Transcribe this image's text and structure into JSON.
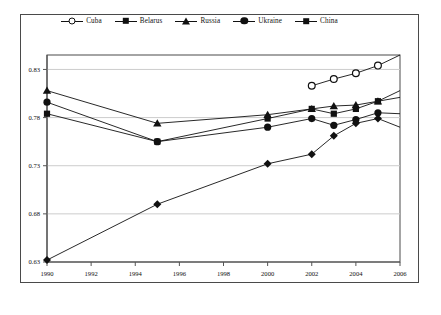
{
  "chart_data": {
    "type": "line",
    "title": "",
    "xlabel": "",
    "ylabel": "",
    "xlim": [
      1990,
      2006
    ],
    "ylim": [
      0.63,
      0.845
    ],
    "grid": true,
    "legend_position": "top-center",
    "xticks": [
      1990,
      1992,
      1994,
      1996,
      1998,
      2000,
      2002,
      2004,
      2006
    ],
    "xtick_labels": [
      "1990",
      "1992",
      "1994",
      "1996",
      "1998",
      "2000",
      "2002",
      "2004",
      "2006"
    ],
    "yticks": [
      0.63,
      0.68,
      0.73,
      0.78,
      0.83
    ],
    "ytick_labels": [
      "0.63",
      "0.68",
      "0.73",
      "0.78",
      "0.83"
    ],
    "series": [
      {
        "name": "Cuba",
        "marker": "open-circle",
        "color": "#111111",
        "x": [
          2002,
          2003,
          2004,
          2005,
          2006
        ],
        "values": [
          0.813,
          0.82,
          0.826,
          0.834,
          0.845
        ]
      },
      {
        "name": "Belarus",
        "marker": "filled-square",
        "color": "#111111",
        "x": [
          1990,
          1995,
          2000,
          2002,
          2003,
          2004,
          2005,
          2006
        ],
        "values": [
          0.784,
          0.755,
          0.779,
          0.789,
          0.784,
          0.789,
          0.797,
          0.801
        ]
      },
      {
        "name": "Russia",
        "marker": "filled-triangle",
        "color": "#111111",
        "x": [
          1990,
          1995,
          2000,
          2002,
          2003,
          2004,
          2005,
          2006
        ],
        "values": [
          0.808,
          0.774,
          0.783,
          0.789,
          0.792,
          0.793,
          0.797,
          0.808
        ]
      },
      {
        "name": "Ukraine",
        "marker": "filled-circle",
        "color": "#111111",
        "x": [
          1990,
          1995,
          2000,
          2002,
          2003,
          2004,
          2005,
          2006
        ],
        "values": [
          0.796,
          0.755,
          0.77,
          0.779,
          0.772,
          0.778,
          0.785,
          0.784
        ]
      },
      {
        "name": "China",
        "marker": "filled-diamond",
        "color": "#111111",
        "x": [
          1990,
          1995,
          2000,
          2002,
          2003,
          2004,
          2005,
          2006
        ],
        "values": [
          0.632,
          0.69,
          0.732,
          0.742,
          0.761,
          0.774,
          0.779,
          0.77
        ]
      }
    ]
  },
  "legend": {
    "items": [
      {
        "label": "Cuba",
        "marker": "open-circle"
      },
      {
        "label": "Belarus",
        "marker": "filled-square"
      },
      {
        "label": "Russia",
        "marker": "filled-triangle"
      },
      {
        "label": "Ukraine",
        "marker": "filled-circle"
      },
      {
        "label": "China",
        "marker": "filled-diamond"
      }
    ]
  }
}
